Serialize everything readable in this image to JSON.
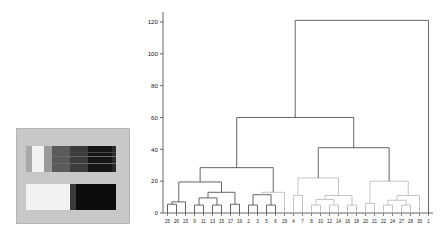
{
  "figure": {
    "kind": "dendrogram-with-image",
    "background": "#ffffff"
  },
  "heatmap": {
    "name": "grayscale-image-panel",
    "panel_background": "#c8c8c8",
    "border": "#b4b4b4",
    "rows": [
      {
        "name": "top-band",
        "x": 10,
        "y": 18,
        "w": 90,
        "h": 26,
        "segments": [
          {
            "x": 0,
            "w": 6,
            "color": "#a8a8a8"
          },
          {
            "x": 6,
            "w": 12,
            "color": "#f2f2f2"
          },
          {
            "x": 18,
            "w": 8,
            "color": "#9a9a9a"
          },
          {
            "x": 26,
            "w": 18,
            "color": "#5a5a5a"
          },
          {
            "x": 44,
            "w": 18,
            "color": "#3c3c3c"
          },
          {
            "x": 62,
            "w": 24,
            "color": "#161616"
          },
          {
            "x": 86,
            "w": 4,
            "color": "#2a2a2a"
          }
        ],
        "scanlines": [
          {
            "y": 10,
            "color": "#6a6a6a",
            "x": 26,
            "w": 64
          },
          {
            "y": 17,
            "color": "#6a6a6a",
            "x": 26,
            "w": 64
          },
          {
            "y": 6,
            "color": "#464646",
            "x": 44,
            "w": 46
          }
        ]
      },
      {
        "name": "bottom-band",
        "x": 10,
        "y": 56,
        "w": 90,
        "h": 26,
        "segments": [
          {
            "x": 0,
            "w": 44,
            "color": "#f2f2f2"
          },
          {
            "x": 44,
            "w": 6,
            "color": "#3a3a3a"
          },
          {
            "x": 50,
            "w": 40,
            "color": "#0d0d0d"
          }
        ],
        "scanlines": []
      }
    ]
  },
  "chart_data": {
    "type": "dendrogram",
    "title": "",
    "xlabel": "",
    "ylabel": "",
    "grid": false,
    "legend": null,
    "axis_color": "#666666",
    "link_color": "#555555",
    "link_color_light": "#b8b8b8",
    "ylim": [
      0,
      125
    ],
    "yticks": [
      0,
      20,
      40,
      60,
      80,
      100,
      120
    ],
    "ytick_labels": [
      "0",
      "20",
      "40",
      "60",
      "80",
      "100",
      "120"
    ],
    "leaf_order": [
      "25",
      "26",
      "23",
      "9",
      "11",
      "13",
      "15",
      "17",
      "19",
      "2",
      "3",
      "5",
      "6",
      "29",
      "4",
      "7",
      "8",
      "10",
      "12",
      "14",
      "16",
      "18",
      "20",
      "21",
      "22",
      "24",
      "27",
      "28",
      "30",
      "1"
    ],
    "n_leaves": 30,
    "links": [
      {
        "id": "L1",
        "left": "leaf:25",
        "right": "leaf:26",
        "height": 5.5,
        "color": "#555555"
      },
      {
        "id": "L2",
        "left": "L1",
        "right": "leaf:23",
        "height": 7.0,
        "color": "#555555"
      },
      {
        "id": "L3",
        "left": "leaf:9",
        "right": "leaf:11",
        "height": 5.0,
        "color": "#555555"
      },
      {
        "id": "L4",
        "left": "leaf:13",
        "right": "leaf:15",
        "height": 5.0,
        "color": "#555555"
      },
      {
        "id": "L5",
        "left": "L3",
        "right": "L4",
        "height": 9.5,
        "color": "#555555"
      },
      {
        "id": "L6",
        "left": "leaf:17",
        "right": "leaf:19",
        "height": 5.5,
        "color": "#555555"
      },
      {
        "id": "L7",
        "left": "L5",
        "right": "L6",
        "height": 13.0,
        "color": "#555555"
      },
      {
        "id": "L8",
        "left": "L2",
        "right": "L7",
        "height": 19.5,
        "color": "#555555"
      },
      {
        "id": "L9",
        "left": "leaf:2",
        "right": "leaf:3",
        "height": 5.0,
        "color": "#555555"
      },
      {
        "id": "L10",
        "left": "leaf:5",
        "right": "leaf:6",
        "height": 5.0,
        "color": "#555555"
      },
      {
        "id": "L11",
        "left": "L9",
        "right": "L10",
        "height": 11.5,
        "color": "#555555"
      },
      {
        "id": "L12",
        "left": "L11",
        "right": "leaf:29",
        "height": 13.0,
        "color": "#bdbdbd"
      },
      {
        "id": "L13",
        "left": "L8",
        "right": "L12",
        "height": 28.5,
        "color": "#555555"
      },
      {
        "id": "L14",
        "left": "leaf:4",
        "right": "leaf:7",
        "height": 11.0,
        "color": "#bdbdbd"
      },
      {
        "id": "L15",
        "left": "leaf:8",
        "right": "leaf:10",
        "height": 5.0,
        "color": "#bdbdbd"
      },
      {
        "id": "L16",
        "left": "leaf:12",
        "right": "leaf:14",
        "height": 5.0,
        "color": "#bdbdbd"
      },
      {
        "id": "L17",
        "left": "L15",
        "right": "L16",
        "height": 8.5,
        "color": "#bdbdbd"
      },
      {
        "id": "L18",
        "left": "leaf:16",
        "right": "leaf:18",
        "height": 5.0,
        "color": "#bdbdbd"
      },
      {
        "id": "L19",
        "left": "L17",
        "right": "L18",
        "height": 11.0,
        "color": "#bdbdbd"
      },
      {
        "id": "L20",
        "left": "L14",
        "right": "L19",
        "height": 22.0,
        "color": "#bdbdbd"
      },
      {
        "id": "L21",
        "left": "leaf:20",
        "right": "leaf:21",
        "height": 6.0,
        "color": "#bdbdbd"
      },
      {
        "id": "L22",
        "left": "leaf:22",
        "right": "leaf:24",
        "height": 5.0,
        "color": "#bdbdbd"
      },
      {
        "id": "L23",
        "left": "leaf:27",
        "right": "leaf:28",
        "height": 5.0,
        "color": "#bdbdbd"
      },
      {
        "id": "L24",
        "left": "L22",
        "right": "L23",
        "height": 8.0,
        "color": "#bdbdbd"
      },
      {
        "id": "L25",
        "left": "L24",
        "right": "leaf:30",
        "height": 11.0,
        "color": "#bdbdbd"
      },
      {
        "id": "L26",
        "left": "L21",
        "right": "L25",
        "height": 20.0,
        "color": "#bdbdbd"
      },
      {
        "id": "L27",
        "left": "L20",
        "right": "L26",
        "height": 41.0,
        "color": "#555555"
      },
      {
        "id": "L28",
        "left": "L13",
        "right": "L27",
        "height": 60.0,
        "color": "#555555"
      },
      {
        "id": "L29",
        "left": "L28",
        "right": "leaf:1",
        "height": 121.0,
        "color": "#555555"
      }
    ]
  }
}
